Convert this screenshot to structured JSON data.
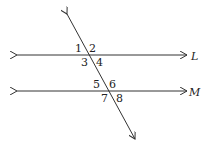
{
  "diagram": {
    "lines": [
      {
        "name": "L",
        "label": "L"
      },
      {
        "name": "M",
        "label": "M"
      }
    ],
    "angles": [
      "1",
      "2",
      "3",
      "4",
      "5",
      "6",
      "7",
      "8"
    ]
  }
}
